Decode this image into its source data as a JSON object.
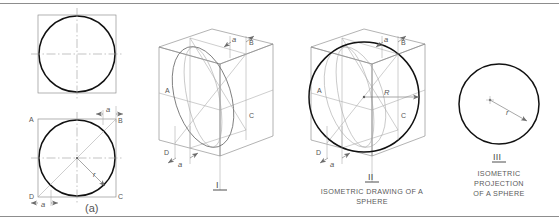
{
  "figure": {
    "page_rules": {
      "top": true,
      "bottom": true
    }
  },
  "panels": [
    {
      "id": "panel-a",
      "caption": "(a)",
      "sub_label": "",
      "point_labels": [
        "A",
        "B",
        "D",
        "C"
      ],
      "dim_labels": [
        "a",
        "a"
      ],
      "radius_label": "r"
    },
    {
      "id": "panel-i",
      "caption": "I",
      "sub_label": "",
      "point_labels": [
        "A",
        "B",
        "D",
        "C"
      ],
      "dim_labels": [
        "a",
        "a"
      ],
      "radius_label": ""
    },
    {
      "id": "panel-ii",
      "caption": "II",
      "sub_label": "ISOMETRIC DRAWING OF A SPHERE",
      "sub_label_line1": "ISOMETRIC DRAWING OF A",
      "sub_label_line2": "SPHERE",
      "point_labels": [
        "A",
        "B",
        "D",
        "C"
      ],
      "dim_labels": [
        "a",
        "a"
      ],
      "radius_label": "R"
    },
    {
      "id": "panel-iii",
      "caption": "III",
      "sub_label": "ISOMETRIC PROJECTION OF A SPHERE",
      "sub_label_line1": "ISOMETRIC",
      "sub_label_line2": "PROJECTION",
      "sub_label_line3": "OF A SPHERE",
      "point_labels": [],
      "dim_labels": [],
      "radius_label": "r"
    }
  ],
  "colors": {
    "outline_thick": "#111111",
    "construction": "#8a8a8a",
    "center_line": "#9a9a9a",
    "text": "#4a4a4a",
    "rule": "#8d8d8d"
  },
  "labels": {
    "A": "A",
    "B": "B",
    "C": "C",
    "D": "D",
    "a": "a",
    "r": "r",
    "R": "R",
    "fig_a": "(a)",
    "fig_i": "I",
    "fig_ii": "II",
    "fig_iii": "III",
    "cap_ii_1": "ISOMETRIC DRAWING OF A",
    "cap_ii_2": "SPHERE",
    "cap_iii_1": "ISOMETRIC",
    "cap_iii_2": "PROJECTION",
    "cap_iii_3": "OF A SPHERE"
  }
}
